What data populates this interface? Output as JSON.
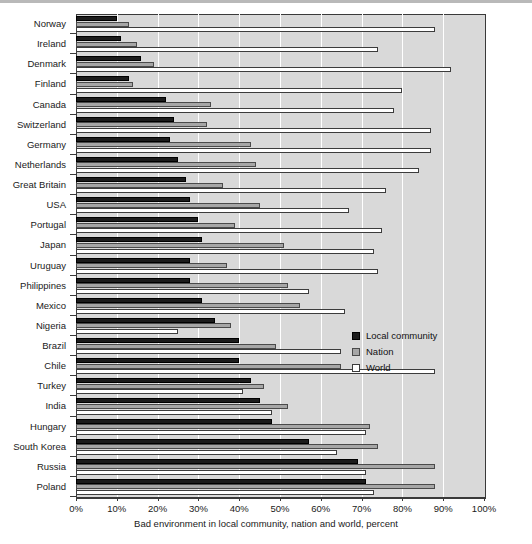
{
  "chart_data": {
    "type": "bar",
    "orientation": "horizontal",
    "title": "",
    "xlabel": "Bad environment in local community, nation and world, percent",
    "ylabel": "",
    "xlim": [
      0,
      100
    ],
    "xticks": [
      "0%",
      "10%",
      "20%",
      "30%",
      "40%",
      "50%",
      "60%",
      "70%",
      "80%",
      "90%",
      "100%"
    ],
    "xtick_values": [
      0,
      10,
      20,
      30,
      40,
      50,
      60,
      70,
      80,
      90,
      100
    ],
    "grid": true,
    "grid_axis": "x",
    "legend_position": "center-right",
    "categories": [
      "Norway",
      "Ireland",
      "Denmark",
      "Finland",
      "Canada",
      "Switzerland",
      "Germany",
      "Netherlands",
      "Great Britain",
      "USA",
      "Portugal",
      "Japan",
      "Uruguay",
      "Philippines",
      "Mexico",
      "Nigeria",
      "Brazil",
      "Chile",
      "Turkey",
      "India",
      "Hungary",
      "South Korea",
      "Russia",
      "Poland"
    ],
    "series": [
      {
        "name": "Local community",
        "color": "#1c1c1c",
        "values": [
          10,
          11,
          16,
          13,
          22,
          24,
          23,
          25,
          27,
          28,
          30,
          31,
          28,
          28,
          31,
          34,
          40,
          40,
          43,
          45,
          48,
          57,
          69,
          71
        ]
      },
      {
        "name": "Nation",
        "color": "#a6a6a6",
        "values": [
          13,
          15,
          19,
          14,
          33,
          32,
          43,
          44,
          36,
          45,
          39,
          51,
          37,
          52,
          55,
          38,
          49,
          65,
          46,
          52,
          72,
          74,
          88,
          88
        ]
      },
      {
        "name": "World",
        "color": "#ffffff",
        "values": [
          88,
          74,
          92,
          80,
          78,
          87,
          87,
          84,
          76,
          67,
          75,
          73,
          74,
          57,
          66,
          25,
          65,
          88,
          41,
          48,
          71,
          64,
          71,
          73
        ]
      }
    ]
  },
  "legend": {
    "items": [
      {
        "label": "Local community",
        "swatch": "local"
      },
      {
        "label": "Nation",
        "swatch": "nation"
      },
      {
        "label": "World",
        "swatch": "world"
      }
    ]
  },
  "axis": {
    "x_title": "Bad environment in local community, nation and world, percent"
  }
}
